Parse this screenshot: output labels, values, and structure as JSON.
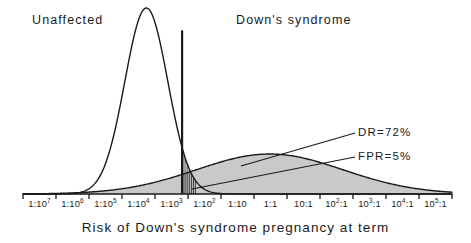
{
  "chart_data": {
    "type": "area",
    "title": "",
    "xlabel": "Risk of Down's syndrome pregnancy at term",
    "ylabel": "",
    "grid": false,
    "legend_position": "inline-annotations",
    "x_tick_labels": [
      "1:10^7",
      "1:10^6",
      "1:10^5",
      "1:10^4",
      "1:10^3",
      "1:10^2",
      "1:10",
      "1:1",
      "10:1",
      "10^2:1",
      "10^3:1",
      "10^4:1",
      "10^5:1"
    ],
    "x_tick_bases": [
      "1:10",
      "1:10",
      "1:10",
      "1:10",
      "1:10",
      "1:10",
      "1:10",
      "1:1",
      "10:1",
      "10",
      "10",
      "10",
      "10"
    ],
    "x_tick_exponents": [
      "7",
      "6",
      "5",
      "4",
      "3",
      "2",
      "",
      "",
      "",
      "2",
      "3",
      "4",
      "5"
    ],
    "x_tick_suffixes": [
      "",
      "",
      "",
      "",
      "",
      "",
      "",
      "",
      "",
      ":1",
      ":1",
      ":1",
      ":1"
    ],
    "xlim_log_odds": [
      -7,
      5
    ],
    "series": [
      {
        "name": "Unaffected",
        "label": "Unaffected",
        "fill": "none",
        "stroke": "#1a1a1a",
        "mean_log_odds": -3.55,
        "sd_log_odds": 0.6,
        "peak_height": 1.0,
        "note": "tall narrow unshaded distribution of unaffected pregnancies"
      },
      {
        "name": "Down's syndrome",
        "label": "Down's syndrome",
        "fill": "#c9c9c9",
        "stroke": "#1a1a1a",
        "mean_log_odds": -0.1,
        "sd_log_odds": 2.05,
        "peak_height": 0.215,
        "note": "broad shaded distribution of Down's syndrome pregnancies"
      }
    ],
    "cutoff": {
      "label": "risk cut-off",
      "log_odds": -2.55,
      "height": 0.88
    },
    "annotations": [
      {
        "name": "detection-rate",
        "text": "DR=72%",
        "value": 72,
        "unit": "%"
      },
      {
        "name": "false-positive-rate",
        "text": "FPR=5%",
        "value": 5,
        "unit": "%"
      }
    ],
    "hatch_region": {
      "name": "false-positive-area",
      "description": "vertical hatching right of cut-off under unaffected curve",
      "line_count": 7
    }
  },
  "labels": {
    "unaffected": "Unaffected",
    "downs": "Down's syndrome",
    "dr": "DR=72%",
    "fpr": "FPR=5%",
    "axis_title": "Risk of Down's syndrome pregnancy at term"
  },
  "colors": {
    "ink": "#1a1a1a",
    "shade": "#c9c9c9",
    "background": "#ffffff"
  }
}
